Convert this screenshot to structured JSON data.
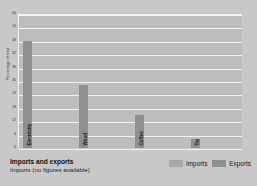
{
  "chart_data": {
    "type": "bar",
    "title": "Imports and exports",
    "subtitle": "Imports (no figures available)",
    "xlabel": "",
    "ylabel": "Percentage of total",
    "ylim": [
      0,
      60
    ],
    "ytick_step": 6,
    "yticks": [
      60,
      54,
      48,
      42,
      36,
      30,
      24,
      18,
      12,
      6,
      0
    ],
    "grid": true,
    "legend_position": "bottom-right",
    "categories": [
      "Electricity",
      "Wood",
      "Coffee",
      "Tin"
    ],
    "series": [
      {
        "name": "Imports",
        "color": "#a8a8a8",
        "values": [
          null,
          null,
          null,
          null
        ],
        "note": "no figures available"
      },
      {
        "name": "Exports",
        "color": "#8f8f8f",
        "values": [
          48,
          28,
          15,
          4
        ]
      }
    ]
  },
  "legend": {
    "items": [
      {
        "label": "Imports",
        "color": "#a8a8a8"
      },
      {
        "label": "Exports",
        "color": "#8f8f8f"
      }
    ]
  },
  "colors": {
    "background": "#c8c8c8",
    "plot_background": "#bdbdbd",
    "gridline": "#f4f4f4",
    "imports": "#a8a8a8",
    "exports": "#8f8f8f"
  }
}
